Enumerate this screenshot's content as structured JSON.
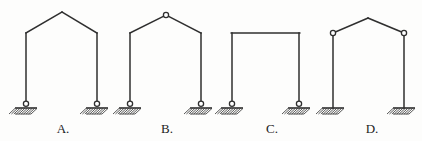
{
  "figure": {
    "kind": "structural-frames-multiple-choice",
    "background_color": "#fdfdfc",
    "line_color": "#2f2f2f",
    "hinge_fill_color": "#ffffff",
    "label_color": "#1c1c1c",
    "width": 422,
    "height": 141,
    "ground_y": 106,
    "eave_y": 33,
    "options": [
      {
        "id": "A",
        "label": "A.",
        "label_x": 63,
        "label_y": 133,
        "roof": "gabled",
        "apex": {
          "x": 62,
          "y": 12,
          "hinge": false
        },
        "left_column_x": 26,
        "right_column_x": 97,
        "eave_left_hinge": false,
        "eave_right_hinge": false,
        "base_left": {
          "type": "pinned",
          "hinge": true
        },
        "base_right": {
          "type": "pinned",
          "hinge": true
        },
        "description": "Gabled frame, rigid apex, rigid eaves, two pinned bases"
      },
      {
        "id": "B",
        "label": "B.",
        "label_x": 167,
        "label_y": 133,
        "roof": "gabled",
        "apex": {
          "x": 166,
          "y": 15,
          "hinge": true
        },
        "left_column_x": 130,
        "right_column_x": 201,
        "eave_left_hinge": false,
        "eave_right_hinge": false,
        "base_left": {
          "type": "pinned",
          "hinge": true
        },
        "base_right": {
          "type": "pinned",
          "hinge": true
        },
        "description": "Gabled frame, hinge at apex, rigid eaves, two pinned bases"
      },
      {
        "id": "C",
        "label": "C.",
        "label_x": 272,
        "label_y": 133,
        "roof": "flat",
        "apex": {
          "x": 266,
          "y": 33,
          "hinge": false
        },
        "left_column_x": 232,
        "right_column_x": 299,
        "eave_left_hinge": false,
        "eave_right_hinge": false,
        "base_left": {
          "type": "pinned",
          "hinge": true
        },
        "base_right": {
          "type": "pinned",
          "hinge": true
        },
        "description": "Rectangular portal frame, flat beam, rigid corners, two pinned bases"
      },
      {
        "id": "D",
        "label": "D.",
        "label_x": 372,
        "label_y": 133,
        "roof": "gabled",
        "apex": {
          "x": 368,
          "y": 18,
          "hinge": false
        },
        "left_column_x": 333,
        "right_column_x": 404,
        "eave_left_hinge": true,
        "eave_right_hinge": true,
        "base_left": {
          "type": "fixed",
          "hinge": false
        },
        "base_right": {
          "type": "fixed",
          "hinge": false
        },
        "description": "Gabled frame, rigid apex, hinges at both eaves, two fixed bases"
      }
    ],
    "support_geometry": {
      "plate_half_width": 11,
      "plate_thickness": 2,
      "hatch_depth": 6,
      "hatch_count": 9,
      "hinge_radius": 2.6
    }
  }
}
